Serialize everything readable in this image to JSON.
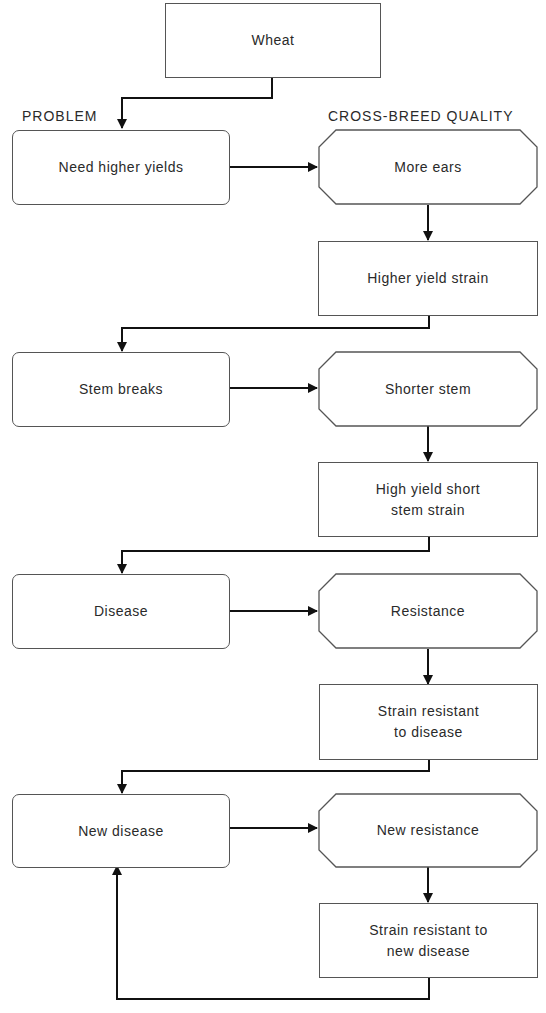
{
  "headers": {
    "problem": "PROBLEM",
    "quality": "CROSS-BREED QUALITY"
  },
  "nodes": {
    "start": "Wheat",
    "problems": [
      "Need higher yields",
      "Stem breaks",
      "Disease",
      "New disease"
    ],
    "qualities": [
      "More ears",
      "Shorter stem",
      "Resistance",
      "New resistance"
    ],
    "strains": [
      "Higher yield strain",
      "High yield short\nstem strain",
      "Strain resistant\nto disease",
      "Strain resistant to\nnew disease"
    ]
  },
  "colors": {
    "line": "#111111",
    "border": "#555555",
    "text": "#2a2a2a",
    "background": "#ffffff"
  }
}
